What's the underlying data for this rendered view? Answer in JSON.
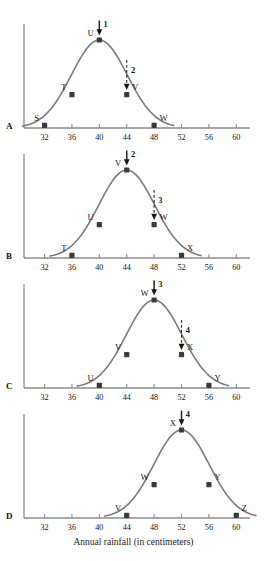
{
  "figure": {
    "axis_caption": "Annual rainfall (in centimeters)",
    "x_ticks": [
      32,
      36,
      40,
      44,
      48,
      52,
      56,
      60
    ],
    "x_min": 29,
    "x_max": 62,
    "curve_color": "#7a7a7a",
    "marker_color": "#3a3a3a",
    "axis_color": "#8a8a8a",
    "text_color": "#151515"
  },
  "panels": [
    {
      "letter": "A",
      "peak_x": 40,
      "points": [
        {
          "label": "S",
          "x": 32,
          "y": 0.03
        },
        {
          "label": "T",
          "x": 36,
          "y": 0.38
        },
        {
          "label": "U",
          "x": 40,
          "y": 1.0
        },
        {
          "label": "V",
          "x": 44,
          "y": 0.38
        },
        {
          "label": "W",
          "x": 48,
          "y": 0.03
        }
      ],
      "arrows": [
        {
          "label": "1",
          "x": 40,
          "style": "solid"
        },
        {
          "label": "2",
          "x": 44,
          "style": "dashed"
        }
      ]
    },
    {
      "letter": "B",
      "peak_x": 44,
      "points": [
        {
          "label": "T",
          "x": 36,
          "y": 0.03
        },
        {
          "label": "U",
          "x": 40,
          "y": 0.38
        },
        {
          "label": "V",
          "x": 44,
          "y": 1.0
        },
        {
          "label": "W",
          "x": 48,
          "y": 0.38
        },
        {
          "label": "X",
          "x": 52,
          "y": 0.03
        }
      ],
      "arrows": [
        {
          "label": "2",
          "x": 44,
          "style": "solid"
        },
        {
          "label": "3",
          "x": 48,
          "style": "dashed"
        }
      ]
    },
    {
      "letter": "C",
      "peak_x": 48,
      "points": [
        {
          "label": "U",
          "x": 40,
          "y": 0.03
        },
        {
          "label": "V",
          "x": 44,
          "y": 0.38
        },
        {
          "label": "W",
          "x": 48,
          "y": 1.0
        },
        {
          "label": "X",
          "x": 52,
          "y": 0.38
        },
        {
          "label": "Y",
          "x": 56,
          "y": 0.03
        }
      ],
      "arrows": [
        {
          "label": "3",
          "x": 48,
          "style": "solid"
        },
        {
          "label": "4",
          "x": 52,
          "style": "dashed"
        }
      ]
    },
    {
      "letter": "D",
      "peak_x": 52,
      "points": [
        {
          "label": "V",
          "x": 44,
          "y": 0.03
        },
        {
          "label": "W",
          "x": 48,
          "y": 0.38
        },
        {
          "label": "X",
          "x": 52,
          "y": 1.0
        },
        {
          "label": "Y",
          "x": 56,
          "y": 0.38
        },
        {
          "label": "Z",
          "x": 60,
          "y": 0.03
        }
      ],
      "arrows": [
        {
          "label": "4",
          "x": 52,
          "style": "solid"
        }
      ]
    }
  ],
  "chart_data": {
    "type": "line",
    "title": "",
    "xlabel": "Annual rainfall (in centimeters)",
    "ylabel": "",
    "xlim": [
      29,
      62
    ],
    "grid": false,
    "legend": "none",
    "x_ticks": [
      32,
      36,
      40,
      44,
      48,
      52,
      56,
      60
    ],
    "series": [
      {
        "name": "A",
        "peak_x": 40,
        "x": [
          32,
          36,
          40,
          44,
          48
        ],
        "values": [
          0.03,
          0.38,
          1.0,
          0.38,
          0.03
        ],
        "point_labels": [
          "S",
          "T",
          "U",
          "V",
          "W"
        ],
        "annotations": [
          {
            "label": "1",
            "x": 40,
            "style": "solid",
            "target": "U"
          },
          {
            "label": "2",
            "x": 44,
            "style": "dashed",
            "target": "V"
          }
        ]
      },
      {
        "name": "B",
        "peak_x": 44,
        "x": [
          36,
          40,
          44,
          48,
          52
        ],
        "values": [
          0.03,
          0.38,
          1.0,
          0.38,
          0.03
        ],
        "point_labels": [
          "T",
          "U",
          "V",
          "W",
          "X"
        ],
        "annotations": [
          {
            "label": "2",
            "x": 44,
            "style": "solid",
            "target": "V"
          },
          {
            "label": "3",
            "x": 48,
            "style": "dashed",
            "target": "W"
          }
        ]
      },
      {
        "name": "C",
        "peak_x": 48,
        "x": [
          40,
          44,
          48,
          52,
          56
        ],
        "values": [
          0.03,
          0.38,
          1.0,
          0.38,
          0.03
        ],
        "point_labels": [
          "U",
          "V",
          "W",
          "X",
          "Y"
        ],
        "annotations": [
          {
            "label": "3",
            "x": 48,
            "style": "solid",
            "target": "W"
          },
          {
            "label": "4",
            "x": 52,
            "style": "dashed",
            "target": "X"
          }
        ]
      },
      {
        "name": "D",
        "peak_x": 52,
        "x": [
          44,
          48,
          52,
          56,
          60
        ],
        "values": [
          0.03,
          0.38,
          1.0,
          0.38,
          0.03
        ],
        "point_labels": [
          "V",
          "W",
          "X",
          "Y",
          "Z"
        ],
        "annotations": [
          {
            "label": "4",
            "x": 52,
            "style": "solid",
            "target": "X"
          }
        ]
      }
    ]
  }
}
